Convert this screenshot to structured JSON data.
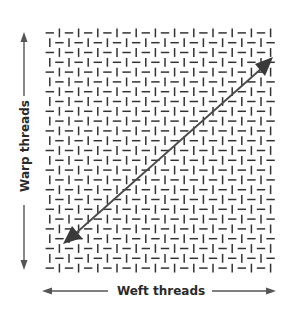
{
  "diagram": {
    "labels": {
      "warp": "Warp threads",
      "weft": "Weft threads"
    },
    "weave": {
      "pattern": "plain-weave",
      "columns": 24,
      "rows": 25
    },
    "arrows": {
      "warp": "vertical-double-arrow",
      "weft": "horizontal-double-arrow",
      "bias": "diagonal-double-arrow"
    },
    "colors": {
      "thread": "#333333",
      "arrow": "#555555",
      "bias_arrow": "#4a4a4a",
      "text": "#2a2a2a",
      "background": "#ffffff"
    }
  }
}
